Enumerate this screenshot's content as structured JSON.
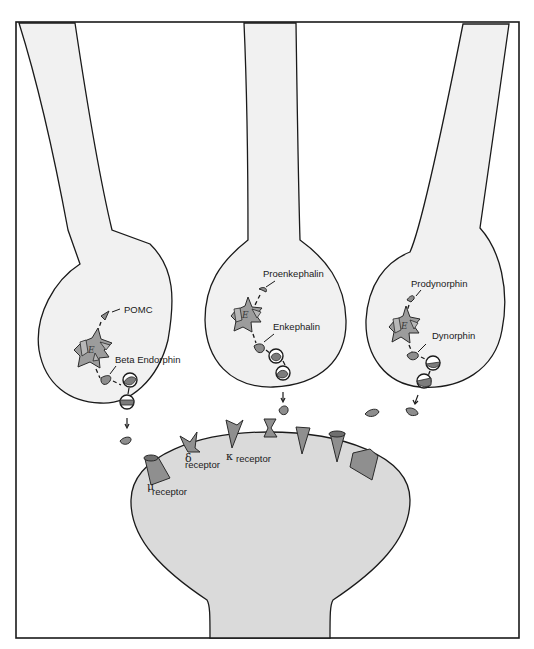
{
  "diagram": {
    "title": "",
    "neurons": [
      {
        "id": "left",
        "precursor_label": "POMC",
        "product_label": "Beta Endorphin",
        "enzyme_symbol": "E"
      },
      {
        "id": "middle",
        "precursor_label": "Proenkephalin",
        "product_label": "Enkephalin",
        "enzyme_symbol": "E"
      },
      {
        "id": "right",
        "precursor_label": "Prodynorphin",
        "product_label": "Dynorphin",
        "enzyme_symbol": "E"
      }
    ],
    "receptors": [
      {
        "symbol": "μ",
        "label": "receptor"
      },
      {
        "symbol": "δ",
        "label": "receptor"
      },
      {
        "symbol": "κ",
        "label": "receptor"
      }
    ],
    "colors": {
      "outline": "#1a1a1a",
      "presynaptic_fill": "#f1f1f1",
      "postsynaptic_fill": "#dadada",
      "molecule_fill": "#8d8d8d"
    }
  }
}
